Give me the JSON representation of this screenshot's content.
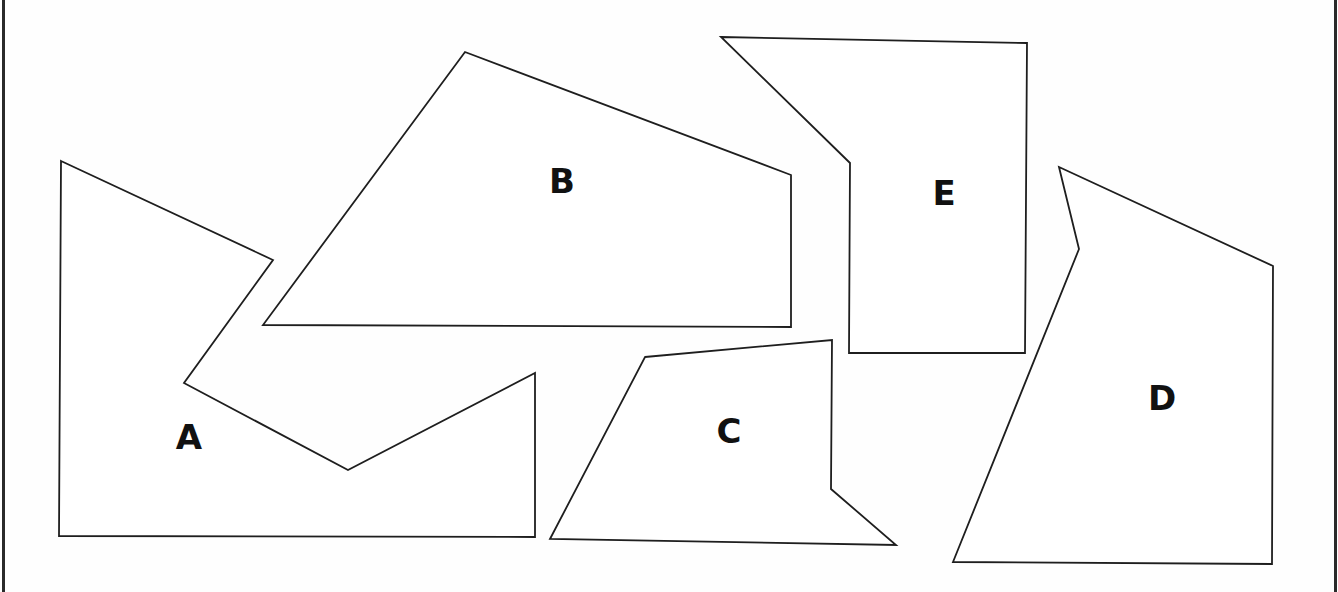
{
  "diagram": {
    "title": "",
    "stroke_color": "#1e1e1e",
    "fill_color": "#ffffff",
    "frame_color": "#2a2a2a",
    "shapes": [
      {
        "id": "A",
        "label": "A",
        "points": "61,161 273,260 184,383 348,470 535,373 535,537 59,536",
        "label_x": 189,
        "label_y": 437
      },
      {
        "id": "B",
        "label": "B",
        "points": "465,52 791,175 791,327 263,325",
        "label_x": 562,
        "label_y": 181
      },
      {
        "id": "C",
        "label": "C",
        "points": "645,357 832,340 831,489 896,545 550,539",
        "label_x": 729,
        "label_y": 431
      },
      {
        "id": "D",
        "label": "D",
        "points": "1059,167 1273,266 1272,564 953,562 1079,249",
        "label_x": 1162,
        "label_y": 398
      },
      {
        "id": "E",
        "label": "E",
        "points": "721,37 1027,43 1025,353 849,353 850,163",
        "label_x": 944,
        "label_y": 193
      }
    ]
  }
}
